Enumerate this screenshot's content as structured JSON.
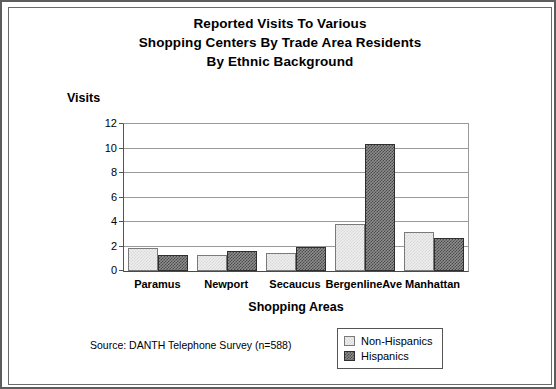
{
  "chart_data": {
    "type": "bar",
    "title": "Reported Visits To Various Shopping Centers By Trade Area Residents By Ethnic Background",
    "title_lines": [
      "Reported Visits To Various",
      "Shopping Centers By Trade Area Residents",
      "By Ethnic Background"
    ],
    "xlabel": "Shopping Areas",
    "ylabel": "Visits",
    "categories": [
      "Paramus",
      "Newport",
      "Secaucus",
      "BergenlineAve",
      "Manhattan"
    ],
    "series": [
      {
        "name": "Non-Hispanics",
        "values": [
          1.9,
          1.3,
          1.5,
          3.8,
          3.2
        ],
        "color": "#eeeeee"
      },
      {
        "name": "Hispanics",
        "values": [
          1.3,
          1.6,
          2.0,
          10.4,
          2.7
        ],
        "color": "#8e8e8e"
      }
    ],
    "ylim": [
      0,
      12
    ],
    "yticks": [
      0,
      2,
      4,
      6,
      8,
      10,
      12
    ],
    "grid": true,
    "legend_position": "bottom-right",
    "annotation": "Source: DANTH Telephone Survey (n=588)"
  },
  "legend": {
    "items": [
      {
        "label": "Non-Hispanics"
      },
      {
        "label": "Hispanics"
      }
    ]
  },
  "source": {
    "text": "Source: DANTH Telephone Survey (n=588)"
  }
}
